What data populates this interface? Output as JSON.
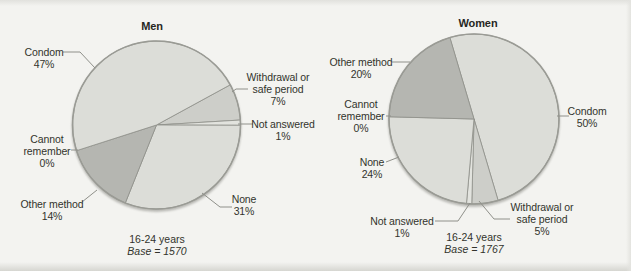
{
  "figure": {
    "background": "#f3f3f0",
    "text_color": "#32332c",
    "line_color": "#8f908a",
    "outline_color": "#9a9b95"
  },
  "chart_data": [
    {
      "type": "pie",
      "title": "Men",
      "caption": {
        "group": "16-24 years",
        "base": "Base = 1570"
      },
      "base_n": 1570,
      "center": {
        "x": 156.5,
        "y": 125
      },
      "radius": 84,
      "start_angle_deg": 61.4,
      "slices": [
        {
          "label": "Withdrawal or\nsafe period",
          "pct": "7%",
          "value": 7,
          "color": "#cdcec9",
          "label_pos": {
            "x": 278,
            "y": 89
          },
          "leader": [
            [
              248,
              89
            ],
            [
              236,
              89
            ],
            [
              232,
              92
            ]
          ]
        },
        {
          "label": "Not answered",
          "pct": "1%",
          "value": 1,
          "color": "#e2e3de",
          "label_pos": {
            "x": 283,
            "y": 130
          },
          "leader": [
            [
              253,
              124
            ],
            [
              238,
              124
            ]
          ]
        },
        {
          "label": "None",
          "pct": "31%",
          "value": 31,
          "color": "#dcddd8",
          "label_pos": {
            "x": 244,
            "y": 205
          },
          "leader": [
            [
              232,
              207
            ],
            [
              220,
              207
            ],
            [
              202,
              193
            ]
          ]
        },
        {
          "label": "Other method",
          "pct": "14%",
          "value": 14,
          "color": "#b5b6b1",
          "label_pos": {
            "x": 52,
            "y": 210
          },
          "leader": [
            [
              82,
              202
            ],
            [
              97,
              190
            ]
          ]
        },
        {
          "label": "Cannot\nremember",
          "pct": "0%",
          "value": 0,
          "color": "#dcddd8",
          "label_pos": {
            "x": 47,
            "y": 151
          },
          "leader": [
            [
              71,
              150
            ],
            [
              78,
              150
            ]
          ]
        },
        {
          "label": "Condom",
          "pct": "47%",
          "value": 47,
          "color": "#dcddd8",
          "label_pos": {
            "x": 44,
            "y": 58
          },
          "leader": [
            [
              63,
              52
            ],
            [
              80,
              52
            ],
            [
              95,
              68
            ]
          ]
        }
      ]
    },
    {
      "type": "pie",
      "title": "Women",
      "caption": {
        "group": "16-24 years",
        "base": "Base = 1767"
      },
      "base_n": 1767,
      "center": {
        "x": 474,
        "y": 119
      },
      "radius": 85,
      "start_angle_deg": 343.5,
      "slices": [
        {
          "label": "Condom",
          "pct": "50%",
          "value": 50,
          "color": "#dcddd8",
          "label_pos": {
            "x": 587,
            "y": 117
          },
          "leader": [
            [
              569,
              116
            ],
            [
              557,
              116
            ]
          ]
        },
        {
          "label": "Withdrawal or\nsafe period",
          "pct": "5%",
          "value": 5,
          "color": "#cdcec9",
          "label_pos": {
            "x": 542,
            "y": 219
          },
          "leader": [
            [
              510,
              219
            ],
            [
              494,
              219
            ],
            [
              479,
              201
            ]
          ]
        },
        {
          "label": "Not answered",
          "pct": "1%",
          "value": 1,
          "color": "#e2e3de",
          "label_pos": {
            "x": 402,
            "y": 227
          },
          "leader": [
            [
              435,
              221
            ],
            [
              458,
              221
            ],
            [
              470,
              203
            ]
          ]
        },
        {
          "label": "None",
          "pct": "24%",
          "value": 24,
          "color": "#dcddd8",
          "label_pos": {
            "x": 372,
            "y": 168
          },
          "leader": [
            [
              386,
              162
            ],
            [
              399,
              157
            ]
          ]
        },
        {
          "label": "Cannot\nremember",
          "pct": "0%",
          "value": 0,
          "color": "#dcddd8",
          "label_pos": {
            "x": 361,
            "y": 116
          },
          "leader": [
            [
              386,
              116
            ],
            [
              391,
              116
            ]
          ]
        },
        {
          "label": "Other method",
          "pct": "20%",
          "value": 20,
          "color": "#b5b6b1",
          "label_pos": {
            "x": 361,
            "y": 68
          },
          "leader": [
            [
              392,
              62
            ],
            [
              410,
              62
            ]
          ]
        }
      ]
    }
  ]
}
